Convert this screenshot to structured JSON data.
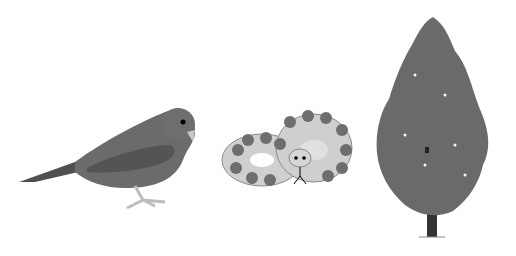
{
  "scene": {
    "background": "#ffffff",
    "figures": [
      {
        "name": "bird",
        "body_color": "#6b6b6b",
        "wing_color": "#555555",
        "beak_color": "#c8c8c8",
        "leg_color": "#bdbdbd"
      },
      {
        "name": "snake",
        "body_color": "#cfcfcf",
        "pattern_color": "#6e6e6e",
        "outline_color": "#8a8a8a"
      },
      {
        "name": "tree",
        "foliage_color": "#6a6a6a",
        "trunk_color": "#333333"
      }
    ]
  }
}
